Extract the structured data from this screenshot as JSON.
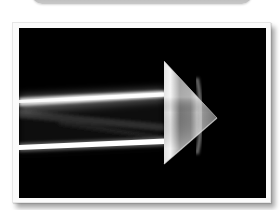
{
  "page": {
    "background_color": "#ffffff"
  },
  "top_card": {
    "color": "#c4c4c4"
  },
  "photo_card": {
    "frame_color": "#fbfbfb",
    "photo_background": "#000000",
    "subject": "Two white light beams entering a triangular glass prism pointing right",
    "elements": {
      "beams": [
        {
          "name": "upper-beam",
          "color": "#f2f2f2"
        },
        {
          "name": "lower-beam",
          "color": "#f7f7f7"
        }
      ],
      "prism": {
        "shape": "triangle",
        "pointing": "right",
        "color": "#9a9a9a"
      }
    }
  }
}
